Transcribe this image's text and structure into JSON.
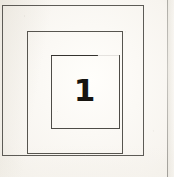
{
  "figure": {
    "background_color": "#f9f7f3",
    "label": "1",
    "label_color": "#16140f",
    "stroke_color": "#55534e",
    "shapes": [
      {
        "name": "outer-square",
        "order": 1,
        "x": 2,
        "y": 5,
        "width": 142,
        "height": 151,
        "stroke": "#5d5b56",
        "stroke_width": 1,
        "fill": "none"
      },
      {
        "name": "middle-square",
        "order": 2,
        "x": 27,
        "y": 31,
        "width": 96,
        "height": 123,
        "stroke": "#57554f",
        "stroke_width": 1,
        "fill": "none"
      },
      {
        "name": "inner-square",
        "order": 3,
        "x": 51,
        "y": 55,
        "width": 69,
        "height": 74,
        "stroke": "#4e4c47",
        "stroke_width": 1,
        "fill": "none",
        "note": "top edge drawn heavier and stops short of the right corner"
      }
    ],
    "artifacts": {
      "scan_edge_line_x": 168,
      "scan_edge_color": "#94928c"
    }
  }
}
